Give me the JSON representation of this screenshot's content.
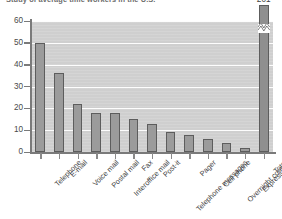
{
  "chart_data": {
    "type": "bar",
    "title": "Study of average time workers in the U.S.",
    "xlabel": "",
    "ylabel": "",
    "ylim": [
      0,
      60
    ],
    "yticks": [
      0,
      10,
      20,
      30,
      40,
      50,
      60
    ],
    "grid": true,
    "legend": "none",
    "axis_break": {
      "bar": "Total",
      "label": "201",
      "note": "y-axis broken; Total bar extends beyond plotted scale"
    },
    "categories": [
      "Telephone",
      "E-mail",
      "Voice mail",
      "Postal mail",
      "Interoffice mail",
      "Fax",
      "Post-it",
      "Telephone messages",
      "Pager",
      "Cell phone",
      "Overnight courier",
      "Express mail",
      "Total"
    ],
    "values": [
      50,
      36,
      22,
      18,
      18,
      15,
      13,
      9,
      8,
      6,
      4,
      2,
      201
    ],
    "value_labels": [
      "",
      "",
      "",
      "",
      "",
      "",
      "",
      "",
      "",
      "",
      "",
      "",
      "201"
    ],
    "colors": {
      "bar_fill": "#9b9b9b",
      "bar_border": "#5d5d5d",
      "plot_background": "#cfcfcf",
      "gridline": "#fdfdfd",
      "axis": "#7a7a7a",
      "text": "#3f3f3f"
    }
  }
}
